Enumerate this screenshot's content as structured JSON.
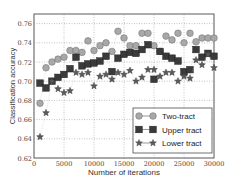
{
  "chart_data": {
    "type": "line",
    "title": "",
    "xlabel": "Number of iterations",
    "ylabel": "Classification accuracy",
    "xlim": [
      0,
      30000
    ],
    "ylim": [
      0.62,
      0.77
    ],
    "xticks": [
      0,
      5000,
      10000,
      15000,
      20000,
      25000,
      30000
    ],
    "xtick_labels": [
      "0",
      "5000",
      "10000",
      "15000",
      "20000",
      "25000",
      "30000"
    ],
    "yticks": [
      0.62,
      0.64,
      0.66,
      0.68,
      0.7,
      0.72,
      0.74,
      0.76
    ],
    "ytick_labels": [
      "0.62",
      "0.64",
      "0.66",
      "0.68",
      "0.70",
      "0.72",
      "0.74",
      "0.76"
    ],
    "grid": true,
    "legend_position": "lower right",
    "x": [
      1000,
      2000,
      3000,
      4000,
      5000,
      6000,
      7000,
      8000,
      9000,
      10000,
      11000,
      12000,
      13000,
      14000,
      15000,
      16000,
      17000,
      18000,
      19000,
      20000,
      21000,
      22000,
      23000,
      24000,
      25000,
      26000,
      27000,
      28000,
      29000,
      30000
    ],
    "series": [
      {
        "name": "Two-tract",
        "marker": "circle",
        "color": "#a8a8a8",
        "values": [
          0.677,
          0.714,
          0.72,
          0.723,
          0.725,
          0.732,
          0.732,
          0.73,
          0.742,
          0.732,
          0.737,
          0.74,
          0.731,
          0.752,
          0.745,
          0.737,
          0.737,
          0.75,
          0.75,
          0.737,
          0.731,
          0.747,
          0.743,
          0.75,
          0.74,
          0.75,
          0.741,
          0.745,
          0.745,
          0.745
        ]
      },
      {
        "name": "Upper tract",
        "marker": "square",
        "color": "#3a3a3a",
        "values": [
          0.698,
          0.693,
          0.7,
          0.704,
          0.707,
          0.713,
          0.725,
          0.716,
          0.718,
          0.719,
          0.721,
          0.726,
          0.71,
          0.724,
          0.728,
          0.73,
          0.729,
          0.733,
          0.738,
          0.702,
          0.731,
          0.726,
          0.724,
          0.721,
          0.71,
          0.712,
          0.733,
          0.725,
          0.729,
          0.726
        ]
      },
      {
        "name": "Lower tract",
        "marker": "star",
        "color": "#5a5a5a",
        "values": [
          0.642,
          0.667,
          0.7,
          0.692,
          0.688,
          0.69,
          0.709,
          0.707,
          0.709,
          0.695,
          0.705,
          0.707,
          0.702,
          0.709,
          0.707,
          0.711,
          0.7,
          0.704,
          0.712,
          0.712,
          0.705,
          0.709,
          0.709,
          0.7,
          0.705,
          0.703,
          0.722,
          0.717,
          0.728,
          0.714
        ]
      }
    ]
  }
}
